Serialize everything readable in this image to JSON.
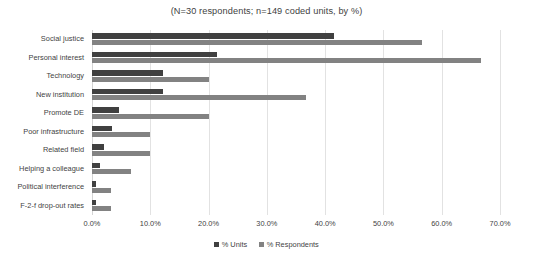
{
  "chart_data": {
    "type": "bar",
    "orientation": "horizontal",
    "title": "(N=30 respondents; n=149 coded units, by %)",
    "xlabel": "",
    "ylabel": "",
    "xlim": [
      0,
      70
    ],
    "xticks": [
      "0.0%",
      "10.0%",
      "20.0%",
      "30.0%",
      "40.0%",
      "50.0%",
      "60.0%",
      "70.0%"
    ],
    "xtick_values": [
      0,
      10,
      20,
      30,
      40,
      50,
      60,
      70
    ],
    "grid": true,
    "legend_position": "bottom",
    "categories": [
      "Social justice",
      "Personal interest",
      "Technology",
      "New institution",
      "Promote DE",
      "Poor infrastructure",
      "Related field",
      "Helping a colleague",
      "Political interference",
      "F-2-f drop-out rates"
    ],
    "series": [
      {
        "name": "% Units",
        "color": "#404040",
        "values": [
          41.6,
          21.5,
          12.1,
          12.1,
          4.7,
          3.4,
          2.0,
          1.3,
          0.7,
          0.7
        ]
      },
      {
        "name": "% Respondents",
        "color": "#828282",
        "values": [
          56.7,
          66.7,
          20.0,
          36.7,
          20.0,
          10.0,
          10.0,
          6.7,
          3.3,
          3.3
        ]
      }
    ]
  },
  "legend": {
    "entries": [
      {
        "label": "% Units",
        "color": "#404040"
      },
      {
        "label": "% Respondents",
        "color": "#828282"
      }
    ]
  }
}
